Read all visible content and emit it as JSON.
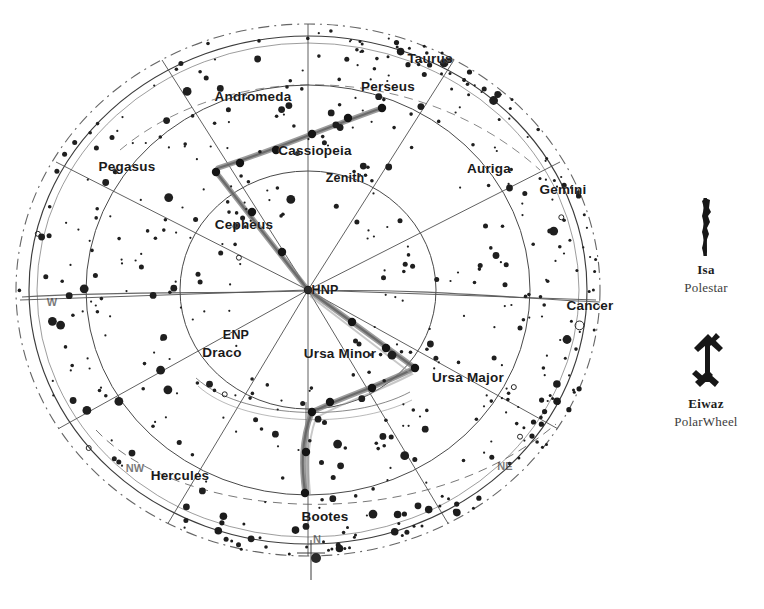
{
  "chart_data": {
    "type": "scatter",
    "projection": "polar sky map centred on HNP",
    "center": {
      "label": "HNP",
      "x": 308,
      "y": 290
    },
    "rings": [
      {
        "name": "outer-dashed-horizon",
        "rx": 292,
        "ry": 266,
        "style": "dash-dot"
      },
      {
        "name": "outer-solid-limb",
        "rx": 279,
        "ry": 254,
        "style": "solid"
      },
      {
        "name": "mid-circle",
        "rx": 222,
        "ry": 205,
        "style": "solid"
      },
      {
        "name": "inner-circle",
        "rx": 128,
        "ry": 119,
        "style": "solid"
      }
    ],
    "equator_line": {
      "name": "celestial-equator",
      "style": "solid-horizontal"
    },
    "radial_lines": 12,
    "constellations": [
      {
        "label": "Taurus",
        "x": 430,
        "y": 58
      },
      {
        "label": "Perseus",
        "x": 388,
        "y": 86
      },
      {
        "label": "Andromeda",
        "x": 253,
        "y": 96
      },
      {
        "label": "Cassiopeia",
        "x": 315,
        "y": 150
      },
      {
        "label": "Auriga",
        "x": 489,
        "y": 168
      },
      {
        "label": "Gemini",
        "x": 563,
        "y": 189
      },
      {
        "label": "Pegasus",
        "x": 127,
        "y": 166
      },
      {
        "label": "Cepheus",
        "x": 244,
        "y": 224
      },
      {
        "label": "Cancer",
        "x": 590,
        "y": 305
      },
      {
        "label": "Draco",
        "x": 222,
        "y": 352
      },
      {
        "label": "Ursa Minor",
        "x": 340,
        "y": 353
      },
      {
        "label": "Ursa Major",
        "x": 468,
        "y": 377
      },
      {
        "label": "Hercules",
        "x": 180,
        "y": 475
      },
      {
        "label": "Bootes",
        "x": 325,
        "y": 516
      }
    ],
    "points": [
      {
        "label": "Zenith",
        "x": 345,
        "y": 178
      },
      {
        "label": "HNP",
        "x": 325,
        "y": 290
      },
      {
        "label": "ENP",
        "x": 236,
        "y": 335
      }
    ],
    "compass": [
      {
        "label": "W",
        "x": 52,
        "y": 302
      },
      {
        "label": "NW",
        "x": 135,
        "y": 468
      },
      {
        "label": "NE",
        "x": 505,
        "y": 466
      },
      {
        "label": "N",
        "x": 317,
        "y": 539
      }
    ],
    "star_count": 430,
    "highlight_paths": [
      {
        "name": "cassiopeia-w-line",
        "color": "#6e6e6e"
      },
      {
        "name": "big-dipper-line",
        "color": "#6e6e6e"
      }
    ]
  },
  "legend": {
    "entries": [
      {
        "icon": "isa-rune-icon",
        "name": "Isa",
        "meaning": "Polestar"
      },
      {
        "icon": "eiwaz-rune-icon",
        "name": "Eiwaz",
        "meaning": "PolarWheel"
      }
    ]
  }
}
